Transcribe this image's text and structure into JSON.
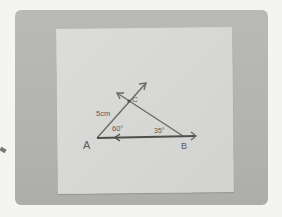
{
  "scene": {
    "description": "Photo of a paper sheet with a hand-drawn triangle construction",
    "background_color": "#f4f4f2",
    "photo_color": "#b5b5b3",
    "paper_color": "#d8d8d6",
    "ink_color": "#5a5a58"
  },
  "diagram": {
    "vertices": {
      "A": "A",
      "B": "B",
      "C": "C"
    },
    "side_label": "5cm",
    "angle_A": "60°",
    "angle_B": "35°"
  }
}
